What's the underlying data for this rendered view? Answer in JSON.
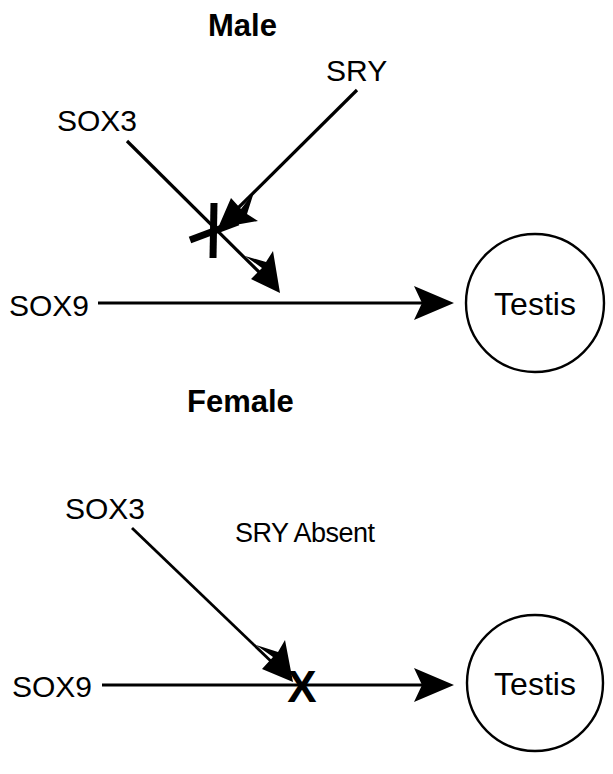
{
  "figure": {
    "background_color": "#ffffff",
    "ink_color": "#000000"
  },
  "panels": [
    {
      "id": "male",
      "title": "Male",
      "nodes": {
        "sox3": "SOX3",
        "sry": "SRY",
        "sox9": "SOX9",
        "outcome": "Testis"
      },
      "marks": {
        "inhibition": "inhibition-bar"
      },
      "edges": [
        {
          "from": "SOX3",
          "to": "SOX9",
          "kind": "arrow",
          "meaning": "repression arrow toward SOX9 pathway"
        },
        {
          "from": "SRY",
          "to": "SOX3 arrow",
          "kind": "arrow",
          "meaning": "SRY blocks the SOX3 input"
        },
        {
          "from": "SOX9",
          "to": "Testis",
          "kind": "arrow",
          "meaning": "SOX9 drives testis formation"
        }
      ]
    },
    {
      "id": "female",
      "title": "Female",
      "nodes": {
        "sox3": "SOX3",
        "sry_status": "SRY Absent",
        "sox9": "SOX9",
        "outcome": "Testis"
      },
      "marks": {
        "block": "X"
      },
      "edges": [
        {
          "from": "SOX3",
          "to": "SOX9",
          "kind": "arrow",
          "meaning": "SOX3 blocks the SOX9 pathway"
        },
        {
          "from": "SOX9",
          "to": "Testis",
          "kind": "arrow",
          "meaning": "SOX9 to testis, blocked at X"
        }
      ]
    }
  ]
}
